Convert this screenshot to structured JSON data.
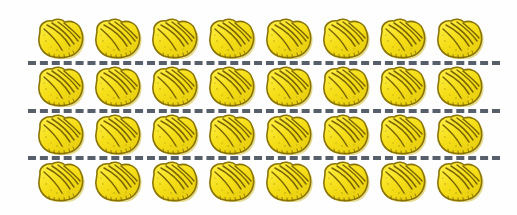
{
  "figure": {
    "type": "equal-groups-array",
    "object_name": "scallop-shell",
    "object_label": "yellow scallop shell",
    "rows": 4,
    "columns": 8,
    "total_objects": 32,
    "objects_per_group": 8,
    "number_of_groups": 4,
    "divider_count": 3,
    "divider_style": "dashed",
    "background_color": "#fefefe"
  },
  "colors": {
    "shell_fill_light": "#FFF04A",
    "shell_fill_mid": "#F5DE17",
    "shell_fill_deep": "#E8CE10",
    "shell_outline": "#8A7406",
    "shell_ridge": "#7A6505",
    "shell_shadow": "#C9B40C",
    "divider_color": "#575f6b",
    "background": "#fefefe"
  },
  "rows": [
    {
      "index": 0,
      "label": "group-1",
      "count": 8,
      "cells": [
        {
          "index": 0,
          "label": "shell-1-1"
        },
        {
          "index": 1,
          "label": "shell-1-2"
        },
        {
          "index": 2,
          "label": "shell-1-3"
        },
        {
          "index": 3,
          "label": "shell-1-4"
        },
        {
          "index": 4,
          "label": "shell-1-5"
        },
        {
          "index": 5,
          "label": "shell-1-6"
        },
        {
          "index": 6,
          "label": "shell-1-7"
        },
        {
          "index": 7,
          "label": "shell-1-8"
        }
      ]
    },
    {
      "index": 1,
      "label": "group-2",
      "count": 8,
      "cells": [
        {
          "index": 0,
          "label": "shell-2-1"
        },
        {
          "index": 1,
          "label": "shell-2-2"
        },
        {
          "index": 2,
          "label": "shell-2-3"
        },
        {
          "index": 3,
          "label": "shell-2-4"
        },
        {
          "index": 4,
          "label": "shell-2-5"
        },
        {
          "index": 5,
          "label": "shell-2-6"
        },
        {
          "index": 6,
          "label": "shell-2-7"
        },
        {
          "index": 7,
          "label": "shell-2-8"
        }
      ]
    },
    {
      "index": 2,
      "label": "group-3",
      "count": 8,
      "cells": [
        {
          "index": 0,
          "label": "shell-3-1"
        },
        {
          "index": 1,
          "label": "shell-3-2"
        },
        {
          "index": 2,
          "label": "shell-3-3"
        },
        {
          "index": 3,
          "label": "shell-3-4"
        },
        {
          "index": 4,
          "label": "shell-3-5"
        },
        {
          "index": 5,
          "label": "shell-3-6"
        },
        {
          "index": 6,
          "label": "shell-3-7"
        },
        {
          "index": 7,
          "label": "shell-3-8"
        }
      ]
    },
    {
      "index": 3,
      "label": "group-4",
      "count": 8,
      "cells": [
        {
          "index": 0,
          "label": "shell-4-1"
        },
        {
          "index": 1,
          "label": "shell-4-2"
        },
        {
          "index": 2,
          "label": "shell-4-3"
        },
        {
          "index": 3,
          "label": "shell-4-4"
        },
        {
          "index": 4,
          "label": "shell-4-5"
        },
        {
          "index": 5,
          "label": "shell-4-6"
        },
        {
          "index": 6,
          "label": "shell-4-7"
        },
        {
          "index": 7,
          "label": "shell-4-8"
        }
      ]
    }
  ],
  "dividers": [
    {
      "index": 0,
      "label": "divider-between-group-1-and-2"
    },
    {
      "index": 1,
      "label": "divider-between-group-2-and-3"
    },
    {
      "index": 2,
      "label": "divider-between-group-3-and-4"
    }
  ]
}
